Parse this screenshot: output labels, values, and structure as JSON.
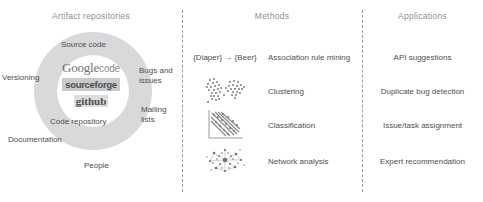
{
  "figure": {
    "width": 483,
    "height": 202,
    "background": "#ffffff",
    "text_color": "#4d4e50",
    "header_color": "#8d8f92",
    "ring_color": "#d8d9da",
    "divider_color": "#9a9c9e"
  },
  "columns": {
    "artifact": {
      "header": "Artifact repositories"
    },
    "methods": {
      "header": "Methods"
    },
    "applications": {
      "header": "Applications"
    }
  },
  "artifact_repositories": {
    "logos": [
      {
        "name": "google-code-logo",
        "primary": "Google",
        "secondary": "code"
      },
      {
        "name": "sourceforge-logo",
        "text": "sourceforge"
      },
      {
        "name": "github-logo",
        "text": "github"
      }
    ],
    "inner_labels": [
      {
        "name": "source-code",
        "text": "Source code"
      },
      {
        "name": "code-repository",
        "text": "Code repository"
      }
    ],
    "outer_labels": [
      {
        "name": "versioning",
        "text": "Versioning"
      },
      {
        "name": "bugs-and-issues",
        "text": "Bugs and issues"
      },
      {
        "name": "mailing-lists",
        "text": "Mailing lists"
      },
      {
        "name": "documentation",
        "text": "Documentation"
      },
      {
        "name": "people",
        "text": "People"
      }
    ]
  },
  "methods": [
    {
      "id": "association-rule-mining",
      "icon": "association-rule-text",
      "visual_text": "{Diaper} → {Beer}",
      "label": "Association rule mining"
    },
    {
      "id": "clustering",
      "icon": "scatter-clusters-icon",
      "visual_text": "",
      "label": "Clustering"
    },
    {
      "id": "classification",
      "icon": "classification-boundary-icon",
      "visual_text": "",
      "label": "Classification"
    },
    {
      "id": "network-analysis",
      "icon": "network-graph-icon",
      "visual_text": "",
      "label": "Network analysis"
    }
  ],
  "applications": [
    {
      "id": "api-suggestions",
      "label": "API suggestions"
    },
    {
      "id": "duplicate-bug-detection",
      "label": "Duplicate bug detection"
    },
    {
      "id": "issue-task-assignment",
      "label": "Issue/task assignment"
    },
    {
      "id": "expert-recommendation",
      "label": "Expert recommendation"
    }
  ]
}
